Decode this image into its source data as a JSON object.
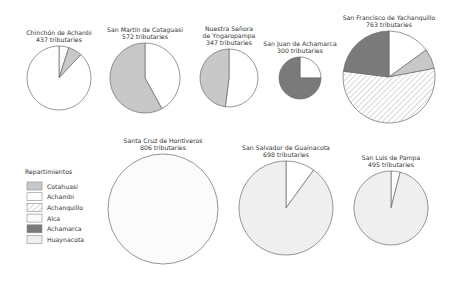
{
  "chart_data": {
    "type": "pie",
    "title": "",
    "legend": {
      "title": "Repartimientos",
      "position": "left",
      "entries": [
        {
          "name": "Cotahuasi",
          "fill": "#c8c8c8",
          "pattern": "solid"
        },
        {
          "name": "Achambi",
          "fill": "#ffffff",
          "pattern": "solid"
        },
        {
          "name": "Achanquillo",
          "fill": "#ffffff",
          "pattern": "hatch"
        },
        {
          "name": "Alca",
          "fill": "#fbfbfb",
          "pattern": "solid"
        },
        {
          "name": "Achamarca",
          "fill": "#7a7a7a",
          "pattern": "solid"
        },
        {
          "name": "Huaynacota",
          "fill": "#f0f0f0",
          "pattern": "stipple"
        }
      ]
    },
    "pies": [
      {
        "title": "Chinchón de Achanbi",
        "subtitle": "437 tributaries",
        "total": 437,
        "cx": 59,
        "cy": 78,
        "r": 32,
        "slices": [
          {
            "name": "Alca",
            "pct": 5
          },
          {
            "name": "Cotahuasi",
            "pct": 7
          },
          {
            "name": "Achambi",
            "pct": 88
          }
        ]
      },
      {
        "title": "San Martín de Cotaguasi",
        "subtitle": "572 tributaries",
        "total": 572,
        "cx": 145,
        "cy": 78,
        "r": 35,
        "slices": [
          {
            "name": "Achambi",
            "pct": 42
          },
          {
            "name": "Cotahuasi",
            "pct": 58
          }
        ]
      },
      {
        "title": "Nuestra Señora de Yngaropampa",
        "title_lines": [
          "Nuestra Señora",
          "de Yngaropampa"
        ],
        "subtitle": "347 tributaries",
        "total": 347,
        "cx": 229,
        "cy": 78,
        "r": 29,
        "slices": [
          {
            "name": "Achambi",
            "pct": 52
          },
          {
            "name": "Cotahuasi",
            "pct": 48
          }
        ]
      },
      {
        "title": "San Juan de Achamarca",
        "subtitle": "300 tributaries",
        "total": 300,
        "cx": 300,
        "cy": 78,
        "r": 21,
        "slices": [
          {
            "name": "Achambi",
            "pct": 25
          },
          {
            "name": "Achamarca",
            "pct": 75
          }
        ]
      },
      {
        "title": "San Francisco de Yachanquillo",
        "subtitle": "763 tributaries",
        "total": 763,
        "cx": 389,
        "cy": 77,
        "r": 46,
        "slices": [
          {
            "name": "Achambi",
            "pct": 15
          },
          {
            "name": "Cotahuasi",
            "pct": 7
          },
          {
            "name": "Achanquillo",
            "pct": 55
          },
          {
            "name": "Achamarca",
            "pct": 23
          }
        ]
      },
      {
        "title": "Santa Cruz de Hontiveros",
        "subtitle": "806 tributaries",
        "total": 806,
        "cx": 163,
        "cy": 209,
        "r": 55,
        "slices": [
          {
            "name": "Alca",
            "pct": 100
          }
        ]
      },
      {
        "title": "San Salvador de Guainacota",
        "subtitle": "698 tributaries",
        "total": 698,
        "cx": 286,
        "cy": 208,
        "r": 47,
        "slices": [
          {
            "name": "Achambi",
            "pct": 10
          },
          {
            "name": "Huaynacota",
            "pct": 90
          }
        ]
      },
      {
        "title": "San Luis de Pampa",
        "subtitle": "495 tributaries",
        "total": 495,
        "cx": 391,
        "cy": 208,
        "r": 37,
        "slices": [
          {
            "name": "Achambi",
            "pct": 4
          },
          {
            "name": "Huaynacota",
            "pct": 96
          }
        ]
      }
    ]
  }
}
